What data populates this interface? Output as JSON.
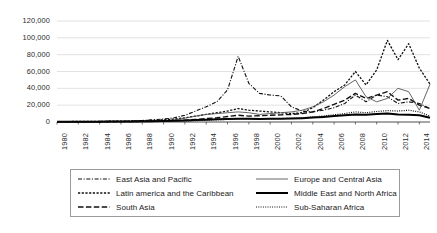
{
  "chart_data": {
    "type": "line",
    "title": "",
    "subtitle": "",
    "xlabel": "",
    "ylabel": "",
    "grid": true,
    "legend_position": "bottom",
    "ylim": [
      0,
      120000
    ],
    "xlim": [
      1980,
      2015
    ],
    "ytick_labels": [
      "120,000",
      "100,000",
      "80,000",
      "60,000",
      "40,000",
      "20,000",
      "0"
    ],
    "ytick_values": [
      120000,
      100000,
      80000,
      60000,
      40000,
      20000,
      0
    ],
    "xtick_labels": [
      "1980",
      "1982",
      "1984",
      "1986",
      "1988",
      "1990",
      "1992",
      "1994",
      "1996",
      "1998",
      "2000",
      "2002",
      "2004",
      "2006",
      "2008",
      "2010",
      "2012",
      "2014"
    ],
    "xtick_values": [
      1980,
      1982,
      1984,
      1986,
      1988,
      1990,
      1992,
      1994,
      1996,
      1998,
      2000,
      2002,
      2004,
      2006,
      2008,
      2010,
      2012,
      2014
    ],
    "x": [
      1980,
      1981,
      1982,
      1983,
      1984,
      1985,
      1986,
      1987,
      1988,
      1989,
      1990,
      1991,
      1992,
      1993,
      1994,
      1995,
      1996,
      1997,
      1998,
      1999,
      2000,
      2001,
      2002,
      2003,
      2004,
      2005,
      2006,
      2007,
      2008,
      2009,
      2010,
      2011,
      2012,
      2013,
      2014,
      2015
    ],
    "series": [
      {
        "name": "East Asia and Pacific",
        "dash": "dashdot",
        "width": 1.1,
        "color": "#111111",
        "values": [
          400,
          450,
          500,
          600,
          700,
          800,
          900,
          1200,
          1800,
          2600,
          3500,
          5000,
          8000,
          13000,
          18000,
          24000,
          38000,
          78000,
          46000,
          34000,
          32000,
          31000,
          18000,
          13000,
          12000,
          14000,
          17000,
          22000,
          32000,
          24000,
          32000,
          30000,
          22000,
          24000,
          22000,
          16000
        ]
      },
      {
        "name": "Latin america and the Caribbean",
        "dash": "finedash",
        "width": 1.3,
        "color": "#111111",
        "values": [
          500,
          550,
          600,
          700,
          800,
          900,
          1000,
          1200,
          1500,
          2000,
          2600,
          3500,
          5000,
          7000,
          9000,
          11000,
          13000,
          16000,
          14000,
          13000,
          12000,
          11000,
          10000,
          11000,
          17000,
          26000,
          36000,
          44000,
          60000,
          44000,
          62000,
          97000,
          74000,
          93000,
          64000,
          45000
        ]
      },
      {
        "name": "South Asia",
        "dash": "longdash",
        "width": 1.4,
        "color": "#111111",
        "values": [
          200,
          220,
          250,
          280,
          320,
          360,
          400,
          500,
          700,
          900,
          1200,
          1600,
          2200,
          3000,
          4000,
          5000,
          6500,
          8000,
          7000,
          7500,
          8000,
          8500,
          9000,
          10000,
          12000,
          16000,
          21000,
          26000,
          34000,
          28000,
          32000,
          36000,
          26000,
          28000,
          20000,
          16000
        ]
      },
      {
        "name": "Europe and Central Asia",
        "dash": "solid-thin",
        "width": 0.9,
        "color": "#555555",
        "values": [
          100,
          120,
          140,
          160,
          190,
          220,
          260,
          320,
          420,
          600,
          1200,
          2500,
          4500,
          7000,
          9000,
          10000,
          11000,
          12000,
          11000,
          9000,
          10000,
          11000,
          12000,
          14000,
          18000,
          24000,
          32000,
          42000,
          50000,
          30000,
          24000,
          28000,
          40000,
          36000,
          14000,
          45000
        ]
      },
      {
        "name": "Middle East and North Africa",
        "dash": "solid-thick",
        "width": 2.0,
        "color": "#000000",
        "values": [
          300,
          320,
          340,
          360,
          400,
          450,
          500,
          600,
          750,
          900,
          1100,
          1400,
          1800,
          2300,
          2800,
          3200,
          3600,
          4000,
          3800,
          3600,
          3800,
          4000,
          4200,
          4600,
          5200,
          6000,
          7000,
          8000,
          9000,
          8500,
          9500,
          10000,
          9000,
          8500,
          8000,
          5000
        ]
      },
      {
        "name": "Sub-Saharan Africa",
        "dash": "dotted",
        "width": 1.2,
        "color": "#111111",
        "values": [
          150,
          160,
          180,
          200,
          230,
          260,
          300,
          360,
          450,
          560,
          700,
          900,
          1200,
          1600,
          2100,
          2600,
          3100,
          3600,
          3400,
          3300,
          3600,
          4000,
          4400,
          5000,
          6000,
          7200,
          8600,
          10000,
          12000,
          11000,
          12500,
          13500,
          13000,
          14000,
          12000,
          7000
        ]
      }
    ]
  },
  "legend": {
    "items": [
      {
        "label": "East Asia and Pacific",
        "style": "dashdot"
      },
      {
        "label": "Europe and Central Asia",
        "style": "solid-thin"
      },
      {
        "label": "Latin america and the Caribbean",
        "style": "finedash"
      },
      {
        "label": "Middle East and North Africa",
        "style": "solid-thick"
      },
      {
        "label": "South Asia",
        "style": "longdash"
      },
      {
        "label": "Sub-Saharan Africa",
        "style": "dotted"
      }
    ]
  }
}
